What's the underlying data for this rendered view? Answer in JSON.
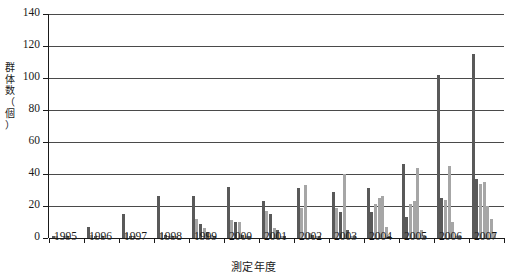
{
  "chart_data": {
    "type": "bar",
    "title": "",
    "xlabel": "測定年度",
    "ylabel": "群体数（個）",
    "ylabel_chars": [
      "群",
      "体",
      "数",
      "（",
      "個",
      "）"
    ],
    "ylim": [
      0,
      140
    ],
    "ytick_values": [
      0,
      20,
      40,
      60,
      80,
      100,
      120,
      140
    ],
    "ytick_labels": [
      "0",
      "20",
      "40",
      "60",
      "80",
      "100",
      "120",
      "140"
    ],
    "grid": true,
    "legend": "none",
    "categories": [
      "1995",
      "1996",
      "1997",
      "1998",
      "1999",
      "2000",
      "2001",
      "2002",
      "2003",
      "2004",
      "2005",
      "2006",
      "2007"
    ],
    "colors": {
      "dark_bar": "#595959",
      "light_bar": "#a6a6a6",
      "axis": "#1a1a1a",
      "gridline": "#4a4a4a",
      "background": "#ffffff"
    },
    "groups": [
      {
        "year": "1995",
        "values": [
          1,
          1,
          0,
          1,
          1,
          0,
          0
        ],
        "shades": [
          "dark",
          "light",
          "dark",
          "light",
          "dark",
          "light",
          "dark"
        ]
      },
      {
        "year": "1996",
        "values": [
          7,
          2,
          1,
          0,
          1,
          0,
          0
        ],
        "shades": [
          "dark",
          "light",
          "dark",
          "light",
          "dark",
          "light",
          "dark"
        ]
      },
      {
        "year": "1997",
        "values": [
          15,
          3,
          1,
          1,
          0,
          0,
          0
        ],
        "shades": [
          "dark",
          "light",
          "dark",
          "light",
          "dark",
          "light",
          "dark"
        ]
      },
      {
        "year": "1998",
        "values": [
          26,
          3,
          2,
          1,
          1,
          1,
          0
        ],
        "shades": [
          "dark",
          "light",
          "dark",
          "light",
          "dark",
          "light",
          "dark"
        ]
      },
      {
        "year": "1999",
        "values": [
          26,
          12,
          9,
          6,
          4,
          2,
          1
        ],
        "shades": [
          "dark",
          "light",
          "dark",
          "light",
          "dark",
          "light",
          "dark"
        ]
      },
      {
        "year": "2000",
        "values": [
          32,
          11,
          10,
          10,
          2,
          1,
          1
        ],
        "shades": [
          "dark",
          "light",
          "dark",
          "light",
          "dark",
          "light",
          "dark"
        ]
      },
      {
        "year": "2001",
        "values": [
          23,
          17,
          15,
          6,
          5,
          1,
          1
        ],
        "shades": [
          "dark",
          "light",
          "dark",
          "light",
          "dark",
          "light",
          "dark"
        ]
      },
      {
        "year": "2002",
        "values": [
          31,
          19,
          33,
          3,
          2,
          1,
          1
        ],
        "shades": [
          "dark",
          "light",
          "light",
          "light",
          "dark",
          "light",
          "dark"
        ]
      },
      {
        "year": "2003",
        "values": [
          29,
          19,
          16,
          40,
          5,
          1,
          1
        ],
        "shades": [
          "dark",
          "light",
          "dark",
          "light",
          "dark",
          "light",
          "dark"
        ]
      },
      {
        "year": "2004",
        "values": [
          31,
          16,
          21,
          25,
          26,
          7,
          1
        ],
        "shades": [
          "dark",
          "dark",
          "light",
          "light",
          "light",
          "light",
          "dark"
        ]
      },
      {
        "year": "2005",
        "values": [
          46,
          13,
          21,
          23,
          44,
          5,
          1
        ],
        "shades": [
          "dark",
          "dark",
          "light",
          "light",
          "light",
          "light",
          "dark"
        ]
      },
      {
        "year": "2006",
        "values": [
          102,
          25,
          24,
          45,
          10,
          1,
          1
        ],
        "shades": [
          "dark",
          "dark",
          "light",
          "light",
          "light",
          "light",
          "dark"
        ]
      },
      {
        "year": "2007",
        "values": [
          115,
          37,
          34,
          35,
          20,
          12,
          4
        ],
        "shades": [
          "dark",
          "dark",
          "light",
          "light",
          "light",
          "light",
          "light"
        ]
      }
    ]
  }
}
